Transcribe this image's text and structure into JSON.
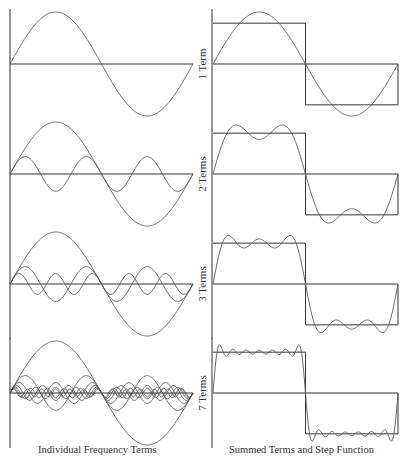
{
  "chart_data": {
    "type": "line",
    "layout": {
      "rows": 4,
      "columns": 2,
      "grid": false,
      "legend": "none"
    },
    "colors": {
      "curve": "#555555",
      "axis": "#333333",
      "background": "#ffffff"
    },
    "columns": [
      {
        "id": "left",
        "caption": "Individual Frequency Terms"
      },
      {
        "id": "right",
        "caption": "Summed Terms and Step Function"
      }
    ],
    "x_range": [
      0,
      6.2832
    ],
    "step_function": {
      "high": 1,
      "low": -1,
      "switch_at": 3.1416
    },
    "term_formula": "(4/pi) * sin(k x) / k, k = 1, 3, 5, ...",
    "rows": [
      {
        "label": "1 Term",
        "terms": 1,
        "harmonics": [
          1
        ]
      },
      {
        "label": "2 Terms",
        "terms": 2,
        "harmonics": [
          1,
          3
        ]
      },
      {
        "label": "3 Terms",
        "terms": 3,
        "harmonics": [
          1,
          3,
          5
        ]
      },
      {
        "label": "7 Terms",
        "terms": 7,
        "harmonics": [
          1,
          3,
          5,
          7,
          9,
          11,
          13
        ]
      }
    ]
  },
  "captions": {
    "left": "Individual Frequency Terms",
    "right": "Summed Terms and Step Function"
  }
}
